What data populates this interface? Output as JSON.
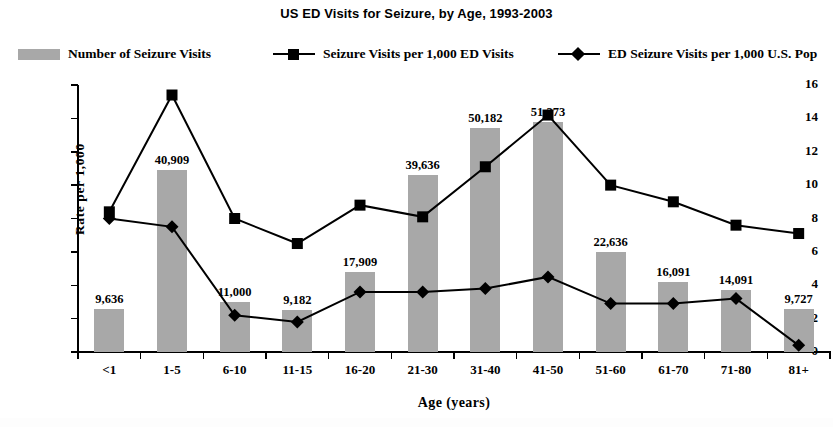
{
  "chart": {
    "title": "US ED Visits for Seizure, by Age, 1993-2003",
    "y_axis_title": "Rate per 1,000",
    "x_axis_title": "Age  (years)"
  },
  "legend": {
    "items": [
      {
        "label": "Number of Seizure Visits",
        "marker": "bar-swatch",
        "color": "#a8a8a8"
      },
      {
        "label": "Seizure Visits per 1,000 ED Visits",
        "marker": "line-square",
        "color": "#000000"
      },
      {
        "label": "ED Seizure Visits per 1,000 U.S. Pop",
        "marker": "line-diamond",
        "color": "#000000"
      }
    ]
  },
  "chart_data": {
    "type": "bar",
    "title": "US ED Visits for Seizure, by Age, 1993-2003",
    "xlabel": "Age  (years)",
    "ylabel": "Rate per 1,000",
    "ylim": [
      0,
      16
    ],
    "yticks": [
      0,
      2,
      4,
      6,
      8,
      10,
      12,
      14,
      16
    ],
    "grid": false,
    "legend_position": "top",
    "categories": [
      "<1",
      "1-5",
      "6-10",
      "11-15",
      "16-20",
      "21-30",
      "31-40",
      "41-50",
      "51-60",
      "61-70",
      "71-80",
      "81+"
    ],
    "bar_labels": [
      "9,636",
      "40,909",
      "11,000",
      "9,182",
      "17,909",
      "39,636",
      "50,182",
      "51,273",
      "22,636",
      "16,091",
      "14,091",
      "9,727"
    ],
    "bar_counts": [
      9636,
      40909,
      11000,
      9182,
      17909,
      39636,
      50182,
      51273,
      22636,
      16091,
      14091,
      9727
    ],
    "bar_scaled_values": [
      2.6,
      10.9,
      3.0,
      2.5,
      4.8,
      10.6,
      13.4,
      13.8,
      6.0,
      4.2,
      3.7,
      2.6
    ],
    "series": [
      {
        "name": "Seizure Visits per 1,000 ED Visits",
        "marker": "square",
        "values": [
          8.4,
          15.4,
          8.0,
          6.5,
          8.8,
          8.1,
          11.1,
          14.2,
          10.0,
          9.0,
          7.6,
          7.1
        ]
      },
      {
        "name": "ED Seizure Visits per 1,000 U.S. Pop",
        "marker": "diamond",
        "values": [
          8.0,
          7.5,
          2.2,
          1.8,
          3.6,
          3.6,
          3.8,
          4.5,
          2.9,
          2.9,
          3.2,
          0.4
        ]
      }
    ]
  }
}
